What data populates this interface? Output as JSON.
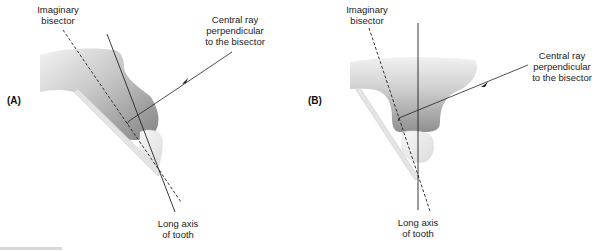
{
  "panels": [
    {
      "id": "A",
      "label": "(A)",
      "bisector_label": [
        "Imaginary",
        "bisector"
      ],
      "central_ray_label": [
        "Central ray",
        "perpendicular",
        "to the bisector"
      ],
      "long_axis_label": [
        "Long axis",
        "of tooth"
      ]
    },
    {
      "id": "B",
      "label": "(B)",
      "bisector_label": [
        "Imaginary",
        "bisector"
      ],
      "central_ray_label": [
        "Central ray",
        "perpendicular",
        "to the bisector"
      ],
      "long_axis_label": [
        "Long axis",
        "of tooth"
      ]
    }
  ],
  "colors": {
    "line": "#222222",
    "film": "#e2e2e2",
    "gum_dark": "#8a8a8a",
    "gum_light": "#e8e8e8",
    "tooth": "#eeeeee"
  }
}
